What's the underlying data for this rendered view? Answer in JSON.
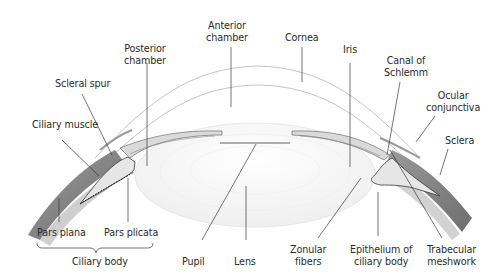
{
  "diagram": {
    "colors": {
      "sclera": "#8a8a8a",
      "sclera_dark": "#6f6f6f",
      "tissue_light": "#d9d9d9",
      "outline": "#3a3a3a",
      "leader": "#3a3a3a",
      "text": "#2b2b2b",
      "cornea_line": "#bdbdbd"
    },
    "labels": {
      "anterior_chamber": "Anterior\nchamber",
      "cornea": "Cornea",
      "posterior_chamber": "Posterior\nchamber",
      "iris": "Iris",
      "canal_of_schlemm": "Canal of\nSchlemm",
      "scleral_spur": "Scleral spur",
      "ocular_conjunctiva": "Ocular\nconjunctiva",
      "ciliary_muscle": "Ciliary muscle",
      "sclera": "Sclera",
      "pars_plana": "Pars plana",
      "pars_plicata": "Pars plicata",
      "ciliary_body": "Ciliary body",
      "pupil": "Pupil",
      "lens": "Lens",
      "zonular_fibers": "Zonular\nfibers",
      "epithelium_of_ciliary_body": "Epithelium of\nciliary body",
      "trabecular_meshwork": "Trabecular\nmeshwork"
    }
  }
}
